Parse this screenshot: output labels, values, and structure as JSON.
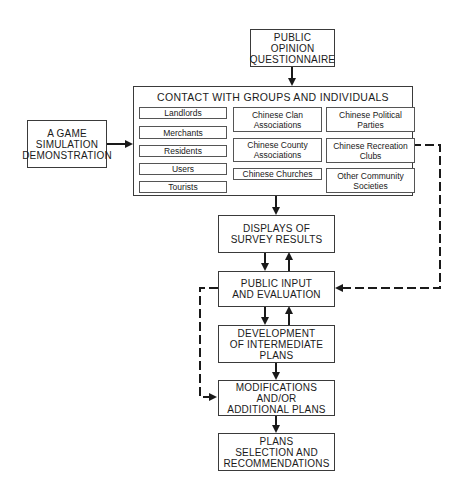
{
  "boxes": {
    "questionnaire": "PUBLIC\nOPINION\nQUESTIONNAIRE",
    "contact_title": "CONTACT WITH GROUPS  AND INDIVIDUALS",
    "game": "A GAME\nSIMULATION\nDEMONSTRATION",
    "displays": "DISPLAYS OF\nSURVEY RESULTS",
    "public_input": "PUBLIC INPUT\nAND EVALUATION",
    "development": "DEVELOPMENT\nOF INTERMEDIATE\nPLANS",
    "modifications": "MODIFICATIONS\nAND/OR\nADDITIONAL PLANS",
    "plans": "PLANS\nSELECTION AND\nRECOMMENDATIONS"
  },
  "groups": {
    "left": [
      "Landlords",
      "Merchants",
      "Residents",
      "Users",
      "Tourists"
    ],
    "middle": [
      "Chinese Clan\nAssociations",
      "Chinese County\nAssociations",
      "Chinese Churches"
    ],
    "right": [
      "Chinese Political\nParties",
      "Chinese Recreation\nClubs",
      "Other Community\nSocieties"
    ]
  },
  "colors": {
    "line": "#1a1a1a",
    "border": "#3a3a3a"
  }
}
